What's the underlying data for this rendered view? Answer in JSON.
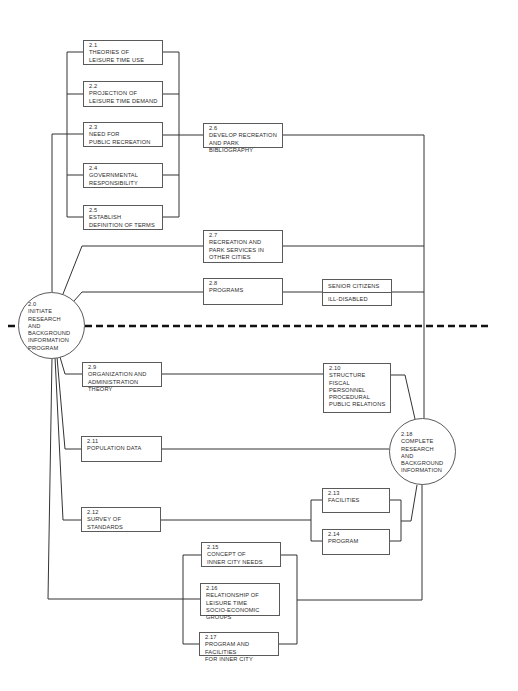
{
  "diagram": {
    "stroke_color": "#333333",
    "dashed_divider": {
      "style": "dashed",
      "color": "#111111"
    },
    "start": {
      "number": "2.0",
      "label": "INITIATE\nRESEARCH\nAND BACKGROUND\nINFORMATION\nPROGRAM"
    },
    "end": {
      "number": "2.18",
      "label": "COMPLETE\nRESEARCH\nAND BACKGROUND\nINFORMATION"
    },
    "nodes": {
      "n2_1": {
        "number": "2.1",
        "label": "THEORIES OF\nLEISURE TIME USE"
      },
      "n2_2": {
        "number": "2.2",
        "label": "PROJECTION OF\nLEISURE TIME DEMAND"
      },
      "n2_3": {
        "number": "2.3",
        "label": "NEED FOR\nPUBLIC RECREATION"
      },
      "n2_4": {
        "number": "2.4",
        "label": "GOVERNMENTAL\nRESPONSIBILITY"
      },
      "n2_5": {
        "number": "2.5",
        "label": "ESTABLISH\nDEFINITION OF TERMS"
      },
      "n2_6": {
        "number": "2.6",
        "label": "DEVELOP RECREATION\nAND PARK BIBLIOGRAPHY"
      },
      "n2_7": {
        "number": "2.7",
        "label": "RECREATION AND\nPARK SERVICES IN\nOTHER CITIES"
      },
      "n2_8": {
        "number": "2.8",
        "label": "PROGRAMS"
      },
      "n2_9": {
        "number": "2.9",
        "label": "ORGANIZATION AND\nADMINISTRATION THEORY"
      },
      "n2_10": {
        "number": "2.10",
        "label": "STRUCTURE\nFISCAL\nPERSONNEL\nPROCEDURAL\nPUBLIC RELATIONS"
      },
      "n2_11": {
        "number": "2.11",
        "label": "POPULATION DATA"
      },
      "n2_12": {
        "number": "2.12",
        "label": "SURVEY OF\nSTANDARDS"
      },
      "n2_13": {
        "number": "2.13",
        "label": "FACILITIES"
      },
      "n2_14": {
        "number": "2.14",
        "label": "PROGRAM"
      },
      "n2_15": {
        "number": "2.15",
        "label": "CONCEPT OF\nINNER CITY NEEDS"
      },
      "n2_16": {
        "number": "2.16",
        "label": "RELATIONSHIP OF\nLEISURE TIME\nSOCIO-ECONOMIC GROUPS"
      },
      "n2_17": {
        "number": "2.17",
        "label": "PROGRAM AND FACILITIES\nFOR INNER CITY"
      }
    },
    "program_groups": [
      "SENIOR CITIZENS",
      "ILL-DISABLED"
    ]
  }
}
